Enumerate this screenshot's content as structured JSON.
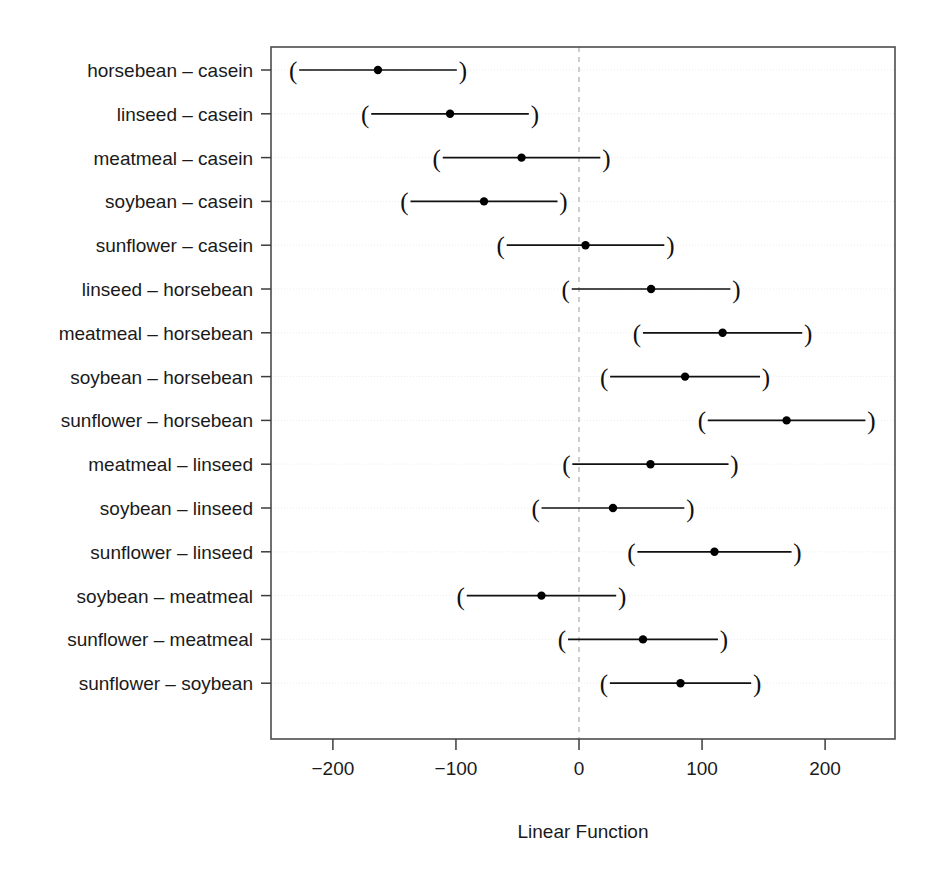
{
  "chart_data": {
    "type": "scatter",
    "title": "",
    "subtitle": "",
    "xlabel": "Linear Function",
    "ylabel": "",
    "xlim": [
      -245,
      257
    ],
    "xticks": [
      -200,
      -100,
      0,
      100,
      200
    ],
    "xticklabels": [
      "−200",
      "−100",
      "0",
      "100",
      "200"
    ],
    "grid": true,
    "legend": null,
    "reference_line": {
      "x": 0,
      "style": "dashed",
      "color": "#b3b3b3"
    },
    "marker": "filled-circle",
    "interval_endpoint_glyphs": [
      "(",
      ")"
    ],
    "categories": [
      "horsebean – casein",
      "linseed – casein",
      "meatmeal – casein",
      "soybean – casein",
      "sunflower – casein",
      "linseed – horsebean",
      "meatmeal – horsebean",
      "soybean – horsebean",
      "sunflower – horsebean",
      "meatmeal – linseed",
      "soybean – linseed",
      "sunflower – linseed",
      "soybean – meatmeal",
      "sunflower – meatmeal",
      "sunflower – soybean"
    ],
    "estimates": [
      -163.4,
      -104.8,
      -46.7,
      -77.2,
      5.3,
      58.6,
      116.7,
      86.2,
      168.7,
      58.1,
      27.6,
      110.1,
      -30.5,
      52.0,
      82.5
    ],
    "lower": [
      -232.3,
      -173.7,
      -115.6,
      -141.8,
      -63.6,
      -10.8,
      47.1,
      20.4,
      99.8,
      -10.3,
      -35.3,
      42.6,
      -96.1,
      -13.8,
      20.2
    ],
    "upper": [
      -94.4,
      -35.9,
      22.2,
      -12.6,
      74.2,
      127.9,
      186.3,
      152.0,
      237.6,
      126.4,
      90.5,
      177.6,
      35.1,
      117.8,
      144.8
    ],
    "series": [
      {
        "name": "Tukey 95% family-wise confidence intervals",
        "points": [
          {
            "label": "horsebean – casein",
            "estimate": -163.4,
            "lower": -232.3,
            "upper": -94.4
          },
          {
            "label": "linseed – casein",
            "estimate": -104.8,
            "lower": -173.7,
            "upper": -35.9
          },
          {
            "label": "meatmeal – casein",
            "estimate": -46.7,
            "lower": -115.6,
            "upper": 22.2
          },
          {
            "label": "soybean – casein",
            "estimate": -77.2,
            "lower": -141.8,
            "upper": -12.6
          },
          {
            "label": "sunflower – casein",
            "estimate": 5.3,
            "lower": -63.6,
            "upper": 74.2
          },
          {
            "label": "linseed – horsebean",
            "estimate": 58.6,
            "lower": -10.8,
            "upper": 127.9
          },
          {
            "label": "meatmeal – horsebean",
            "estimate": 116.7,
            "lower": 47.1,
            "upper": 186.3
          },
          {
            "label": "soybean – horsebean",
            "estimate": 86.2,
            "lower": 20.4,
            "upper": 152.0
          },
          {
            "label": "sunflower – horsebean",
            "estimate": 168.7,
            "lower": 99.8,
            "upper": 237.6
          },
          {
            "label": "meatmeal – linseed",
            "estimate": 58.1,
            "lower": -10.3,
            "upper": 126.4
          },
          {
            "label": "soybean – linseed",
            "estimate": 27.6,
            "lower": -35.3,
            "upper": 90.5
          },
          {
            "label": "sunflower – linseed",
            "estimate": 110.1,
            "lower": 42.6,
            "upper": 177.6
          },
          {
            "label": "soybean – meatmeal",
            "estimate": -30.5,
            "lower": -96.1,
            "upper": 35.1
          },
          {
            "label": "sunflower – meatmeal",
            "estimate": 52.0,
            "lower": -13.8,
            "upper": 117.8
          },
          {
            "label": "sunflower – soybean",
            "estimate": 82.5,
            "lower": 20.2,
            "upper": 144.8
          }
        ]
      }
    ]
  },
  "layout": {
    "plot_left_px": 271,
    "plot_right_px": 895,
    "plot_top_px": 47,
    "plot_bottom_px": 739,
    "x_zero_px": 579,
    "px_per_unit": 1.2305,
    "row_first_y_px": 70,
    "row_spacing_px": 43.8
  },
  "style": {
    "frame_color": "#4d4d4d",
    "interval_color": "#111111",
    "point_color": "#000000",
    "grid_color": "#ececec",
    "reference_color": "#b8b8b8",
    "text_color": "#1a1a1a",
    "background": "#ffffff"
  }
}
